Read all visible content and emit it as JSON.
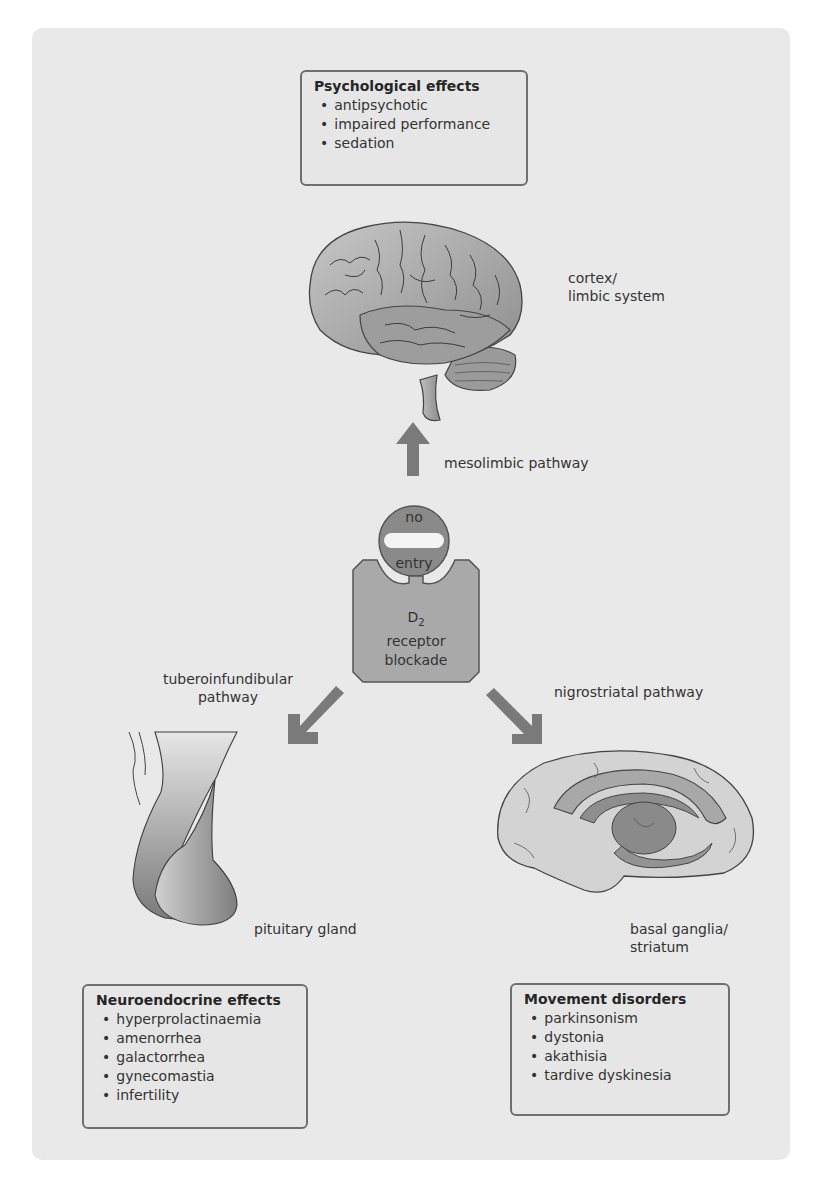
{
  "diagram": {
    "center": {
      "no_entry_top": "no",
      "no_entry_bottom": "entry",
      "receptor_line1": "D",
      "receptor_subscript": "2",
      "receptor_line2": "receptor",
      "receptor_line3": "blockade"
    },
    "pathways": {
      "mesolimbic": "mesolimbic pathway",
      "tuberoinfundibular_line1": "tuberoinfundibular",
      "tuberoinfundibular_line2": "pathway",
      "nigrostriatal": "nigrostriatal pathway"
    },
    "structures": {
      "cortex_line1": "cortex/",
      "cortex_line2": "limbic system",
      "pituitary": "pituitary gland",
      "basal_line1": "basal ganglia/",
      "basal_line2": "striatum"
    },
    "boxes": {
      "psychological": {
        "title": "Psychological effects",
        "items": [
          "antipsychotic",
          "impaired performance",
          "sedation"
        ]
      },
      "neuroendocrine": {
        "title": "Neuroendocrine effects",
        "items": [
          "hyperprolactinaemia",
          "amenorrhea",
          "galactorrhea",
          "gynecomastia",
          "infertility"
        ]
      },
      "movement": {
        "title": "Movement disorders",
        "items": [
          "parkinsonism",
          "dystonia",
          "akathisia",
          "tardive dyskinesia"
        ]
      }
    },
    "colors": {
      "panel": "#e9e9e9",
      "arrow": "#7a7a7a",
      "no_entry": "#8a8a8a",
      "receptor": "#a9a9a9",
      "border": "#6f6f6f"
    }
  }
}
